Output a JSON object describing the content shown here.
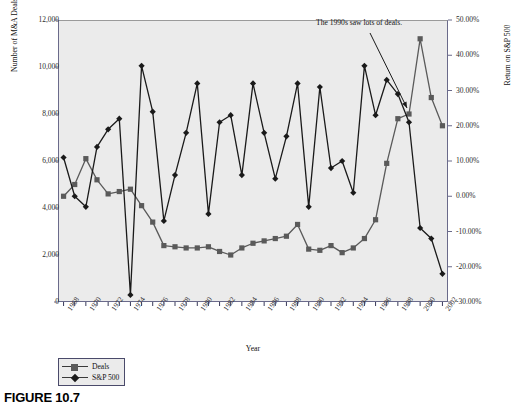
{
  "figure": {
    "caption": "FIGURE 10.7"
  },
  "annotation": {
    "text": "The 1990s saw lots of deals."
  },
  "axis_titles": {
    "left": "Number of M&A Deals",
    "right": "Return on S&P 500",
    "bottom": "Year"
  },
  "legend": {
    "items": [
      {
        "label": "Deals",
        "marker": "square",
        "color": "#5a5a5a"
      },
      {
        "label": "S&P 500",
        "marker": "diamond",
        "color": "#1a1a1a"
      }
    ]
  },
  "colors": {
    "plot_background": "#ebebeb",
    "axis": "#6a6a8a",
    "deals_series": "#5a5a5a",
    "sp500_series": "#1a1a1a",
    "text": "#111111"
  },
  "chart_data": {
    "type": "line",
    "title": "",
    "subtitle": "",
    "xlabel": "Year",
    "ylabel": "Number of M&A Deals",
    "y2label": "Return on S&P 500",
    "grid": false,
    "legend_position": "bottom-left",
    "x": [
      1968,
      1969,
      1970,
      1971,
      1972,
      1973,
      1974,
      1975,
      1976,
      1977,
      1978,
      1979,
      1980,
      1981,
      1982,
      1983,
      1984,
      1985,
      1986,
      1987,
      1988,
      1989,
      1990,
      1991,
      1992,
      1993,
      1994,
      1995,
      1996,
      1997,
      1998,
      1999,
      2000,
      2001,
      2002
    ],
    "xtick_labels": [
      "1968",
      "1970",
      "1972",
      "1974",
      "1976",
      "1978",
      "1980",
      "1982",
      "1984",
      "1986",
      "1988",
      "1990",
      "1992",
      "1994",
      "1996",
      "1998",
      "2000",
      "2002"
    ],
    "xtick_step": 2,
    "xlim": [
      1968,
      2002
    ],
    "ylim": [
      0,
      12000
    ],
    "ytick_labels": [
      "0",
      "2,000",
      "4,000",
      "6,000",
      "8,000",
      "10,000",
      "12,000"
    ],
    "ytick_values": [
      0,
      2000,
      4000,
      6000,
      8000,
      10000,
      12000
    ],
    "y2lim": [
      -0.3,
      0.5
    ],
    "y2tick_labels": [
      "-30.00%",
      "-20.00%",
      "-10.00%",
      "0.00%",
      "10.00%",
      "20.00%",
      "30.00%",
      "40.00%",
      "50.00%"
    ],
    "y2tick_values": [
      -0.3,
      -0.2,
      -0.1,
      0.0,
      0.1,
      0.2,
      0.3,
      0.4,
      0.5
    ],
    "series": [
      {
        "name": "Deals",
        "axis": "left",
        "marker": "square",
        "color": "#5a5a5a",
        "values": [
          4500,
          5000,
          6100,
          5200,
          4600,
          4700,
          4800,
          4100,
          3400,
          2400,
          2350,
          2300,
          2300,
          2350,
          2150,
          2000,
          2300,
          2500,
          2600,
          2700,
          2800,
          3300,
          2250,
          2200,
          2400,
          2100,
          2300,
          2700,
          3500,
          5900,
          7800,
          8000,
          11200,
          8700,
          7500
        ]
      },
      {
        "name": "S&P 500",
        "axis": "right",
        "marker": "diamond",
        "color": "#1a1a1a",
        "values": [
          0.11,
          0.0,
          -0.03,
          0.14,
          0.19,
          0.22,
          -0.28,
          0.37,
          0.24,
          -0.07,
          0.06,
          0.18,
          0.32,
          -0.05,
          0.21,
          0.23,
          0.06,
          0.32,
          0.18,
          0.05,
          0.17,
          0.32,
          -0.03,
          0.31,
          0.08,
          0.1,
          0.01,
          0.37,
          0.23,
          0.33,
          0.29,
          0.21,
          -0.09,
          -0.12,
          -0.22
        ]
      }
    ],
    "annotations": [
      {
        "text": "The 1990s saw lots of deals.",
        "points_to_year": 1999
      }
    ]
  }
}
